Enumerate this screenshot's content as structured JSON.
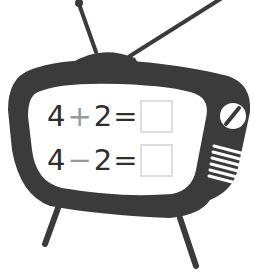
{
  "illustration": {
    "subject": "retro-tv",
    "colors": {
      "body": "#3b3b3b",
      "screen": "#ffffff",
      "operator": "#9a9a9a",
      "digits": "#2e2e2e",
      "answer_box_border": "#dedede"
    }
  },
  "equations": [
    {
      "left": "4",
      "operator": "+",
      "right": "2",
      "equals": "=",
      "answer": ""
    },
    {
      "left": "4",
      "operator": "−",
      "right": "2",
      "equals": "=",
      "answer": ""
    }
  ]
}
